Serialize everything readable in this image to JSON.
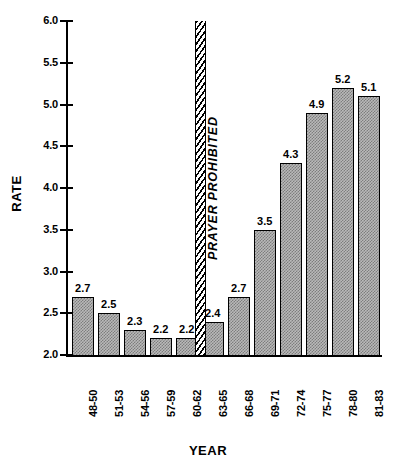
{
  "chart_data": {
    "type": "bar",
    "title": "",
    "xlabel": "YEAR",
    "ylabel": "RATE",
    "categories": [
      "48-50",
      "51-53",
      "54-56",
      "57-59",
      "60-62",
      "63-65",
      "66-68",
      "69-71",
      "72-74",
      "75-77",
      "78-80",
      "81-83"
    ],
    "values": [
      2.7,
      2.5,
      2.3,
      2.2,
      2.2,
      2.4,
      2.7,
      3.5,
      4.3,
      4.9,
      5.2,
      5.1
    ],
    "value_labels": [
      "2.7",
      "2.5",
      "2.3",
      "2.2",
      "2.2",
      "2.4",
      "2.7",
      "3.5",
      "4.3",
      "4.9",
      "5.2",
      "5.1"
    ],
    "ylim": [
      2.0,
      6.0
    ],
    "yticks": [
      2.0,
      2.5,
      3.0,
      3.5,
      4.0,
      4.5,
      5.0,
      5.5,
      6.0
    ],
    "ytick_labels": [
      "2.0",
      "2.5",
      "3.0",
      "3.5",
      "4.0",
      "4.5",
      "5.0",
      "5.5",
      "6.0"
    ],
    "grid": false,
    "legend": "none",
    "bar_color": "#b9b9b9",
    "bar_edge_color": "#000000",
    "annotations": [
      {
        "text": "PRAYER PROHIBITED",
        "style": "hatched vertical band with rotated bold italic label",
        "between_categories": [
          "60-62",
          "63-65"
        ],
        "spans_full_height": true
      }
    ]
  }
}
